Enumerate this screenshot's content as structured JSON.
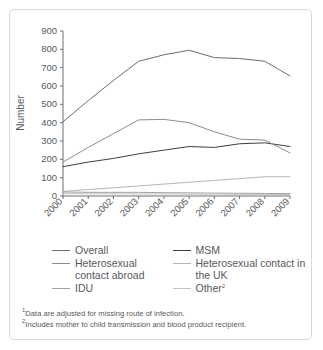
{
  "chart_data": {
    "type": "line",
    "title": "",
    "xlabel": "",
    "ylabel": "Number",
    "x": [
      "2000",
      "2001",
      "2002",
      "2003",
      "2004",
      "2005",
      "2006",
      "2007",
      "2008",
      "2009"
    ],
    "ylim": [
      0,
      900
    ],
    "ytick_step": 100,
    "yticks": [
      "0",
      "100",
      "200",
      "300",
      "400",
      "500",
      "600",
      "700",
      "800",
      "900"
    ],
    "grid": false,
    "legend_position": "below",
    "series": [
      {
        "name": "Overall",
        "color": "#6d6e70",
        "values": [
          405,
          520,
          630,
          735,
          770,
          795,
          755,
          750,
          735,
          655
        ]
      },
      {
        "name": "MSM",
        "color": "#3f3f41",
        "values": [
          160,
          185,
          205,
          230,
          250,
          270,
          265,
          285,
          290,
          270
        ]
      },
      {
        "name": "Heterosexual contact abroad",
        "color": "#8c8c8e",
        "values": [
          185,
          265,
          340,
          415,
          418,
          400,
          350,
          310,
          305,
          235
        ]
      },
      {
        "name": "Heterosexual contact in the UK",
        "color": "#b5b5b7",
        "values": [
          25,
          35,
          45,
          55,
          65,
          75,
          85,
          95,
          105,
          105
        ]
      },
      {
        "name": "IDU",
        "color": "#a0a0a2",
        "values": [
          22,
          20,
          20,
          20,
          18,
          17,
          16,
          15,
          14,
          13
        ]
      },
      {
        "name": "Other",
        "color": "#c4c4c6",
        "values": [
          13,
          12,
          12,
          11,
          11,
          10,
          10,
          9,
          9,
          8
        ]
      }
    ]
  },
  "legend": {
    "items": [
      {
        "label": "Overall",
        "color": "#6d6e70"
      },
      {
        "label": "MSM",
        "color": "#3f3f41"
      },
      {
        "label": "Heterosexual contact abroad",
        "color": "#8c8c8e"
      },
      {
        "label": "Heterosexual contact in the UK",
        "color": "#b5b5b7"
      },
      {
        "label": "IDU",
        "color": "#a0a0a2"
      },
      {
        "label": "Other",
        "color": "#c4c4c6",
        "sup": "2"
      }
    ]
  },
  "notes": {
    "note1_sup": "1",
    "note1": "Data are adjusted for missing route of infection.",
    "note2_sup": "2",
    "note2": "Includes mother to child transmission and blood product recipient."
  }
}
